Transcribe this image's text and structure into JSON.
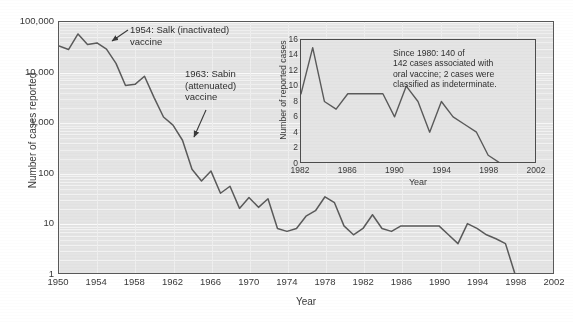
{
  "chart_data": [
    {
      "id": "main",
      "type": "line",
      "title": "",
      "xlabel": "Year",
      "ylabel": "Number of cases reported",
      "yscale": "log",
      "ylim": [
        1,
        100000
      ],
      "xlim": [
        1950,
        2002
      ],
      "ytick_labels": [
        "100,000",
        "10,000",
        "1,000",
        "100",
        "10",
        "1"
      ],
      "ytick_values": [
        100000,
        10000,
        1000,
        100,
        10,
        1
      ],
      "xtick_labels": [
        "1950",
        "1954",
        "1958",
        "1962",
        "1966",
        "1970",
        "1974",
        "1978",
        "1982",
        "1986",
        "1990",
        "1994",
        "1998",
        "2002"
      ],
      "xtick_values": [
        1950,
        1954,
        1958,
        1962,
        1966,
        1970,
        1974,
        1978,
        1982,
        1986,
        1990,
        1994,
        1998,
        2002
      ],
      "grid": "horizontal",
      "legend": "none",
      "x": [
        1950,
        1951,
        1952,
        1953,
        1954,
        1955,
        1956,
        1957,
        1958,
        1959,
        1960,
        1961,
        1962,
        1963,
        1964,
        1965,
        1966,
        1967,
        1968,
        1969,
        1970,
        1971,
        1972,
        1973,
        1974,
        1975,
        1976,
        1977,
        1978,
        1979,
        1980,
        1981,
        1982,
        1983,
        1984,
        1985,
        1986,
        1987,
        1988,
        1989,
        1990,
        1991,
        1992,
        1993,
        1994,
        1995,
        1996,
        1997,
        1998,
        1999,
        2000,
        2001,
        2002
      ],
      "y": [
        33300,
        28400,
        57900,
        35600,
        38500,
        28900,
        15100,
        5500,
        5800,
        8400,
        3200,
        1300,
        900,
        450,
        120,
        70,
        110,
        40,
        55,
        20,
        33,
        21,
        31,
        8,
        7,
        8,
        14,
        18,
        34,
        26,
        9,
        6,
        8,
        15,
        8,
        7,
        9,
        9,
        9,
        9,
        9,
        6,
        4,
        10,
        8,
        6,
        5,
        4,
        1,
        1,
        1,
        1,
        1
      ],
      "annotations": [
        {
          "name": "salk-annotation",
          "text": "1954: Salk (inactivated)\nvaccine",
          "point_year": 1954,
          "point_value": 33000
        },
        {
          "name": "sabin-annotation",
          "text": "1963: Sabin\n(attenuated)\nvaccine",
          "point_year": 1963,
          "point_value": 480
        }
      ]
    },
    {
      "id": "inset",
      "type": "line",
      "title": "",
      "xlabel": "Year",
      "ylabel": "Number of reported cases",
      "yscale": "linear",
      "ylim": [
        0,
        16
      ],
      "xlim": [
        1982,
        2002
      ],
      "ytick_labels": [
        "16",
        "14",
        "12",
        "10",
        "8",
        "6",
        "4",
        "2",
        "0"
      ],
      "ytick_values": [
        16,
        14,
        12,
        10,
        8,
        6,
        4,
        2,
        0
      ],
      "xtick_labels": [
        "1982",
        "1986",
        "1990",
        "1994",
        "1998",
        "2002"
      ],
      "xtick_values": [
        1982,
        1986,
        1990,
        1994,
        1998,
        2002
      ],
      "grid": "none",
      "legend": "none",
      "x": [
        1982,
        1983,
        1984,
        1985,
        1986,
        1987,
        1988,
        1989,
        1990,
        1991,
        1992,
        1993,
        1994,
        1995,
        1996,
        1997,
        1998,
        1999,
        2000,
        2001,
        2002
      ],
      "y": [
        9,
        15,
        8,
        7,
        9,
        9,
        9,
        9,
        6,
        10,
        8,
        4,
        8,
        6,
        5,
        4,
        1,
        0,
        0,
        0,
        0
      ],
      "note": "Since 1980: 140 of\n142 cases associated with\noral vaccine; 2 cases were\nclassified as indeterminate."
    }
  ],
  "main": {
    "ylabel": "Number of cases reported",
    "xlabel": "Year",
    "yticks": [
      "100,000",
      "10,000",
      "1,000",
      "100",
      "10",
      "1"
    ],
    "xticks": [
      "1950",
      "1954",
      "1958",
      "1962",
      "1966",
      "1970",
      "1974",
      "1978",
      "1982",
      "1986",
      "1990",
      "1994",
      "1998",
      "2002"
    ],
    "annotation_salk": "1954: Salk (inactivated)\nvaccine",
    "annotation_sabin": "1963: Sabin\n(attenuated)\nvaccine"
  },
  "inset": {
    "ylabel": "Number of reported cases",
    "xlabel": "Year",
    "yticks": [
      "16",
      "14",
      "12",
      "10",
      "8",
      "6",
      "4",
      "2",
      "0"
    ],
    "xticks": [
      "1982",
      "1986",
      "1990",
      "1994",
      "1998",
      "2002"
    ],
    "note": "Since 1980: 140 of\n142 cases associated with\noral vaccine; 2 cases were\nclassified as indeterminate."
  },
  "colors": {
    "plot_background": "#e4e4e4",
    "line": "#5a5a5a",
    "axis": "#595959",
    "text": "#3a3a3a",
    "page_background": "#ffffff"
  }
}
